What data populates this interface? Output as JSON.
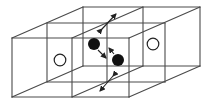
{
  "diagram": {
    "title": "",
    "colors": {
      "line": "#4a4a4a",
      "filled_particle": "#111111",
      "open_particle": "#ffffff"
    },
    "box": {
      "front_x": [
        12,
        72,
        129
      ],
      "front_y": [
        38,
        97
      ],
      "depth_offset": {
        "mid": [
          35,
          -15
        ],
        "back": [
          71,
          -31
        ]
      }
    },
    "particles": [
      {
        "type": "filled",
        "cx": 94,
        "cy": 44,
        "r": 6
      },
      {
        "type": "filled",
        "cx": 118,
        "cy": 60,
        "r": 6
      },
      {
        "type": "open",
        "cx": 60,
        "cy": 60,
        "r": 6
      },
      {
        "type": "open",
        "cx": 153,
        "cy": 44,
        "r": 6
      }
    ],
    "arrows": [
      {
        "name": "top-flux",
        "from": [
          101,
          30
        ],
        "to": [
          116,
          14
        ],
        "double": true
      },
      {
        "name": "bottom-flux",
        "from": [
          114,
          76
        ],
        "to": [
          100,
          91
        ],
        "double": true
      },
      {
        "name": "particle-1-motion",
        "from": [
          97,
          50
        ],
        "to": [
          106,
          59
        ]
      },
      {
        "name": "particle-2-motion",
        "from": [
          115,
          54
        ],
        "to": [
          108,
          47
        ]
      }
    ]
  }
}
